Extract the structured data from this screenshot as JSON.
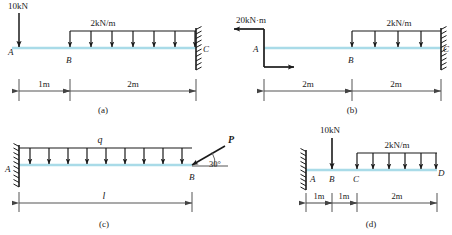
{
  "figure": {
    "beam_color": "#a9dbe8",
    "line_color": "#222222",
    "panels": [
      {
        "id": "a",
        "caption": "(a)",
        "supports": [
          {
            "type": "fixed",
            "at": "C",
            "side": "right"
          }
        ],
        "point_loads": [
          {
            "label": "10kN",
            "at": "A"
          }
        ],
        "distributed_loads": [
          {
            "label": "2kN/m",
            "from": "B",
            "to": "C",
            "arrow_count": 7
          }
        ],
        "node_labels": [
          "A",
          "B",
          "C"
        ],
        "dimensions": [
          "1m",
          "2m"
        ]
      },
      {
        "id": "b",
        "caption": "(b)",
        "supports": [
          {
            "type": "fixed",
            "at": "C",
            "side": "right"
          }
        ],
        "moments": [
          {
            "label": "20kN·m",
            "at": "A"
          }
        ],
        "distributed_loads": [
          {
            "label": "2kN/m",
            "from": "B",
            "to": "C",
            "arrow_count": 4
          }
        ],
        "node_labels": [
          "A",
          "B",
          "C"
        ],
        "dimensions": [
          "2m",
          "2m"
        ]
      },
      {
        "id": "c",
        "caption": "(c)",
        "supports": [
          {
            "type": "fixed",
            "at": "A",
            "side": "left"
          }
        ],
        "inclined_loads": [
          {
            "label": "P",
            "angle_label": "30°",
            "at": "B"
          }
        ],
        "distributed_loads": [
          {
            "label": "q",
            "from": "A",
            "to": "B",
            "arrow_count": 9
          }
        ],
        "node_labels": [
          "A",
          "B"
        ],
        "dimensions": [
          "l"
        ]
      },
      {
        "id": "d",
        "caption": "(d)",
        "supports": [
          {
            "type": "fixed",
            "at": "A",
            "side": "left"
          }
        ],
        "point_loads": [
          {
            "label": "10kN",
            "at": "B"
          }
        ],
        "distributed_loads": [
          {
            "label": "2kN/m",
            "from": "C",
            "to": "D",
            "arrow_count": 6
          }
        ],
        "node_labels": [
          "A",
          "B",
          "C",
          "D"
        ],
        "dimensions": [
          "1m",
          "1m",
          "2m"
        ]
      }
    ]
  },
  "text": {
    "a": {
      "caption": "(a)",
      "point_load": "10kN",
      "dist_load": "2kN/m",
      "nodeA": "A",
      "nodeB": "B",
      "nodeC": "C",
      "dim1": "1m",
      "dim2": "2m"
    },
    "b": {
      "caption": "(b)",
      "moment": "20kN·m",
      "dist_load": "2kN/m",
      "nodeA": "A",
      "nodeB": "B",
      "nodeC": "C",
      "dim1": "2m",
      "dim2": "2m"
    },
    "c": {
      "caption": "(c)",
      "dist_load": "q",
      "force": "P",
      "angle": "30°",
      "nodeA": "A",
      "nodeB": "B",
      "dim1": "l"
    },
    "d": {
      "caption": "(d)",
      "point_load": "10kN",
      "dist_load": "2kN/m",
      "nodeA": "A",
      "nodeB": "B",
      "nodeC": "C",
      "nodeD": "D",
      "dim1": "1m",
      "dim2": "1m",
      "dim3": "2m"
    }
  }
}
